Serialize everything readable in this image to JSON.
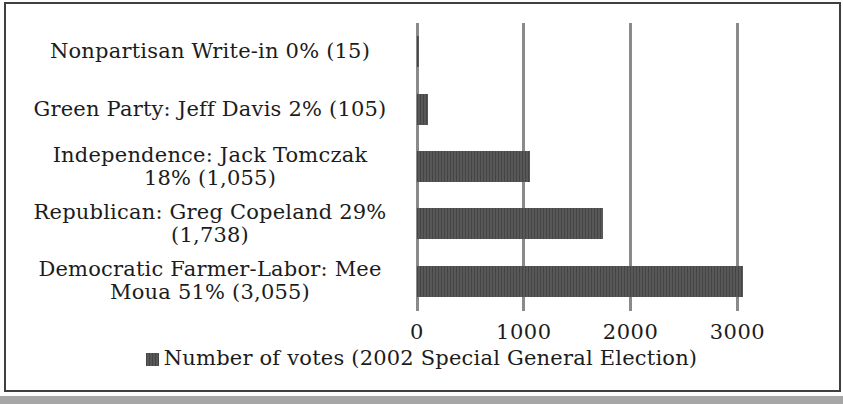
{
  "chart_data": {
    "type": "bar",
    "orientation": "horizontal",
    "title": "",
    "categories": [
      "Nonpartisan Write-in",
      "Green Party: Jeff Davis",
      "Independence: Jack Tomczak",
      "Republican: Greg Copeland",
      "Democratic Farmer-Labor: Mee Moua"
    ],
    "values": [
      15,
      105,
      1055,
      1738,
      3055
    ],
    "percent_labels": [
      "0%",
      "2%",
      "18%",
      "29%",
      "51%"
    ],
    "category_display_lines": [
      [
        "Nonpartisan Write-in 0% (15)"
      ],
      [
        "Green Party: Jeff Davis 2% (105)"
      ],
      [
        "Independence: Jack Tomczak",
        "18% (1,055)"
      ],
      [
        "Republican: Greg Copeland 29%",
        "(1,738)"
      ],
      [
        "Democratic Farmer-Labor: Mee",
        "Moua 51% (3,055)"
      ]
    ],
    "x_tick_labels": [
      "0",
      "1000",
      "2000",
      "3000"
    ],
    "x_tick_values": [
      0,
      1000,
      2000,
      3000
    ],
    "xlim": [
      0,
      3500
    ],
    "grid": true,
    "legend": {
      "label": "Number of votes (2002 Special General Election)",
      "position": "bottom"
    },
    "colors": {
      "bar": "#505050",
      "gridline": "#8a8a8a",
      "text": "#1c1c1c",
      "frame_border": "#3f3f3f",
      "scan_band": "#a6a6a6"
    }
  }
}
